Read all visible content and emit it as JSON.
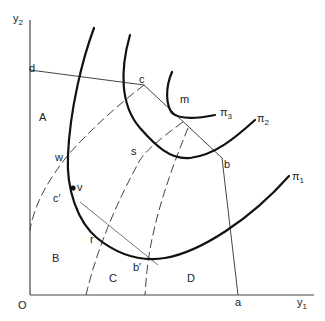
{
  "axes": {
    "origin_label": "O",
    "x_label": "y",
    "x_sub": "1",
    "y_label": "y",
    "y_sub": "2"
  },
  "points": {
    "a": "a",
    "b": "b",
    "c": "c",
    "d": "d",
    "m": "m",
    "s": "s",
    "w": "w",
    "v": "v",
    "r": "r",
    "c_prime": "c′",
    "b_prime": "b′"
  },
  "regions": {
    "A": "A",
    "B": "B",
    "C": "C",
    "D": "D"
  },
  "curves": {
    "pi1": {
      "symbol": "π",
      "sub": "1"
    },
    "pi2": {
      "symbol": "π",
      "sub": "2"
    },
    "pi3": {
      "symbol": "π",
      "sub": "3"
    }
  }
}
